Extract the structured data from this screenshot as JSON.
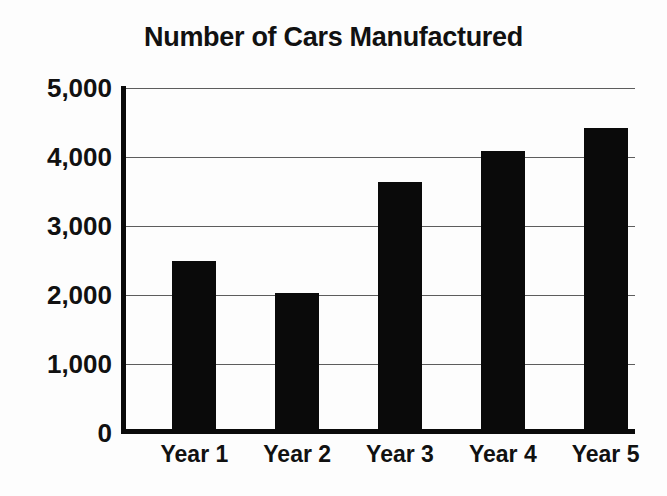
{
  "chart_data": {
    "type": "bar",
    "title": "Number of Cars Manufactured",
    "xlabel": "",
    "ylabel": "",
    "categories": [
      "Year 1",
      "Year 2",
      "Year 3",
      "Year 4",
      "Year 5"
    ],
    "values": [
      2500,
      2030,
      3640,
      4080,
      4420
    ],
    "series": [
      {
        "name": "Number of Cars Manufactured",
        "values": [
          2500,
          2030,
          3640,
          4080,
          4420
        ]
      }
    ],
    "ylim": [
      0,
      5000
    ],
    "y_ticks": [
      0,
      1000,
      2000,
      3000,
      4000,
      5000
    ],
    "y_tick_labels": [
      "0",
      "1,000",
      "2,000",
      "3,000",
      "4,000",
      "5,000"
    ],
    "grid": true,
    "legend": false,
    "legend_position": "none",
    "bar_color": "#0a0a0a",
    "gridline_color": "#5d5d5d",
    "axis_color": "#0a0a0a",
    "background_color": "#fdfdfd",
    "text_color": "#111111"
  }
}
